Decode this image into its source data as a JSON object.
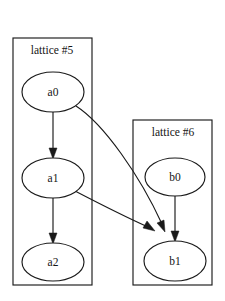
{
  "diagram": {
    "type": "directed-graph",
    "title": "",
    "background_color": "#ffffff",
    "stroke_color": "#1a1a1a",
    "node_fill_color": "#ffffff",
    "clusters": [
      {
        "id": "cluster-5",
        "label": "lattice #5",
        "label_x": 52,
        "label_y": 51,
        "box": {
          "x": 13,
          "y": 38,
          "width": 79,
          "height": 247
        },
        "node_ids": [
          "a0",
          "a1",
          "a2"
        ]
      },
      {
        "id": "cluster-6",
        "label": "lattice #6",
        "label_x": 173,
        "label_y": 133,
        "box": {
          "x": 133,
          "y": 120,
          "width": 79,
          "height": 165
        },
        "node_ids": [
          "b0",
          "b1"
        ]
      }
    ],
    "nodes": [
      {
        "id": "a0",
        "label": "a0",
        "cx": 53,
        "cy": 92,
        "rx": 31,
        "ry": 20
      },
      {
        "id": "a1",
        "label": "a1",
        "cx": 53,
        "cy": 178,
        "rx": 31,
        "ry": 20
      },
      {
        "id": "a2",
        "label": "a2",
        "cx": 53,
        "cy": 262,
        "rx": 31,
        "ry": 19
      },
      {
        "id": "b0",
        "label": "b0",
        "cx": 175,
        "cy": 177,
        "rx": 30,
        "ry": 19
      },
      {
        "id": "b1",
        "label": "b1",
        "cx": 175,
        "cy": 261,
        "rx": 31,
        "ry": 20
      }
    ],
    "edges": [
      {
        "id": "a0-a1",
        "from": "a0",
        "to": "a1",
        "shape": "straight",
        "path": "M 53 112 L 53 152",
        "arrow": {
          "x": 53,
          "y": 158,
          "angle": 90
        }
      },
      {
        "id": "a1-a2",
        "from": "a1",
        "to": "a2",
        "shape": "straight",
        "path": "M 53 198 L 53 237",
        "arrow": {
          "x": 53,
          "y": 243,
          "angle": 90
        }
      },
      {
        "id": "a0-b1",
        "from": "a0",
        "to": "b1",
        "shape": "curved",
        "path": "M 76 106 C 104 124 140 176 160 222",
        "arrow": {
          "x": 163,
          "y": 230,
          "angle": 68
        }
      },
      {
        "id": "a1-b1",
        "from": "a1",
        "to": "b1",
        "shape": "curved",
        "path": "M 75 191 C 100 204 126 217 146 226",
        "arrow": {
          "x": 152,
          "y": 229,
          "angle": 26
        }
      },
      {
        "id": "b0-b1",
        "from": "b0",
        "to": "b1",
        "shape": "straight",
        "path": "M 175 196 L 175 235",
        "arrow": {
          "x": 175,
          "y": 241,
          "angle": 90
        }
      }
    ]
  }
}
